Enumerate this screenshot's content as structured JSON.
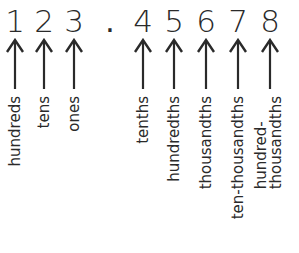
{
  "diagram": {
    "title": "",
    "number_display": "123.45678",
    "decimal_point": ".",
    "places": [
      {
        "digit": "1",
        "label": "hundreds",
        "x": 0
      },
      {
        "digit": "2",
        "label": "tens",
        "x": 29
      },
      {
        "digit": "3",
        "label": "ones",
        "x": 59
      },
      {
        "digit": "4",
        "label": "tenths",
        "x": 128
      },
      {
        "digit": "5",
        "label": "hundredths",
        "x": 159
      },
      {
        "digit": "6",
        "label": "thousandths",
        "x": 191
      },
      {
        "digit": "7",
        "label": "ten-thousandths",
        "x": 223
      },
      {
        "digit": "8",
        "label": "hundred-\nthousandths",
        "x": 255
      }
    ],
    "colors": {
      "ink": "#2a2a2a",
      "background": "#ffffff"
    }
  }
}
